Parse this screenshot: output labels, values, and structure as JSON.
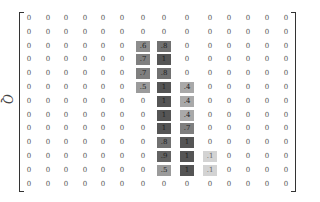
{
  "matrix": {
    "label": "Q",
    "rows": 13,
    "cols": 14,
    "shade_color_dark": "#555555",
    "shade_color_light": "#d8d8d8",
    "values": [
      [
        "0",
        "0",
        "0",
        "0",
        "0",
        "0",
        "0",
        "0",
        "0",
        "0",
        "0",
        "0",
        "0",
        "0"
      ],
      [
        "0",
        "0",
        "0",
        "0",
        "0",
        "0",
        "0",
        "0",
        "0",
        "0",
        "0",
        "0",
        "0",
        "0"
      ],
      [
        "0",
        "0",
        "0",
        "0",
        "0",
        "0",
        ".6",
        ".8",
        "0",
        "0",
        "0",
        "0",
        "0",
        "0"
      ],
      [
        "0",
        "0",
        "0",
        "0",
        "0",
        "0",
        ".7",
        "1",
        "0",
        "0",
        "0",
        "0",
        "0",
        "0"
      ],
      [
        "0",
        "0",
        "0",
        "0",
        "0",
        "0",
        ".7",
        ".8",
        "0",
        "0",
        "0",
        "0",
        "0",
        "0"
      ],
      [
        "0",
        "0",
        "0",
        "0",
        "0",
        "0",
        ".5",
        "1",
        ".4",
        "0",
        "0",
        "0",
        "0",
        "0"
      ],
      [
        "0",
        "0",
        "0",
        "0",
        "0",
        "0",
        "0",
        "1",
        ".4",
        "0",
        "0",
        "0",
        "0",
        "0"
      ],
      [
        "0",
        "0",
        "0",
        "0",
        "0",
        "0",
        "0",
        "1",
        ".4",
        "0",
        "0",
        "0",
        "0",
        "0"
      ],
      [
        "0",
        "0",
        "0",
        "0",
        "0",
        "0",
        "0",
        "1",
        ".7",
        "0",
        "0",
        "0",
        "0",
        "0"
      ],
      [
        "0",
        "0",
        "0",
        "0",
        "0",
        "0",
        "0",
        ".8",
        "1",
        "0",
        "0",
        "0",
        "0",
        "0"
      ],
      [
        "0",
        "0",
        "0",
        "0",
        "0",
        "0",
        "0",
        ".9",
        "1",
        ".1",
        "0",
        "0",
        "0",
        "0"
      ],
      [
        "0",
        "0",
        "0",
        "0",
        "0",
        "0",
        "0",
        ".5",
        "1",
        ".1",
        "0",
        "0",
        "0",
        "0"
      ],
      [
        "0",
        "0",
        "0",
        "0",
        "0",
        "0",
        "0",
        "0",
        "0",
        "0",
        "0",
        "0",
        "0",
        "0"
      ]
    ]
  }
}
